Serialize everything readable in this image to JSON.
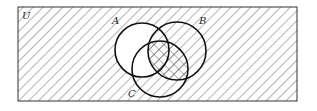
{
  "diagram": {
    "type": "venn",
    "universe_label": "U",
    "sets": [
      {
        "name": "A",
        "label": "A"
      },
      {
        "name": "B",
        "label": "B"
      },
      {
        "name": "C",
        "label": "C"
      }
    ],
    "shading": {
      "single_hatch": "complement of A, plus A∩B",
      "cross_hatch": "B∩C",
      "unshaded": "A only and A∩C outside B"
    },
    "colors": {
      "stroke": "#111111",
      "hatch": "#555555",
      "background": "#ffffff"
    }
  }
}
